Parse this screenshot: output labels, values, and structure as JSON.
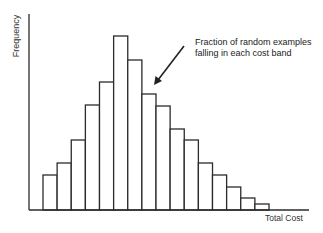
{
  "chart_data": {
    "type": "bar",
    "title": "",
    "xlabel": "Total Cost",
    "ylabel": "Frequency",
    "categories": [
      "1",
      "2",
      "3",
      "4",
      "5",
      "6",
      "7",
      "8",
      "9",
      "10",
      "11",
      "12",
      "13",
      "14",
      "15",
      "16"
    ],
    "values": [
      35,
      47,
      70,
      105,
      128,
      174,
      150,
      116,
      104,
      81,
      70,
      47,
      35,
      23,
      12,
      6
    ],
    "value_units": "relative frequency (unlabeled axis, estimated bar heights)",
    "ylim": [
      0,
      196
    ],
    "grid": false,
    "legend": null,
    "x_ticks": [],
    "y_ticks": [],
    "annotations": [
      {
        "text_lines": [
          "Fraction of random examples",
          "falling in each cost band"
        ],
        "arrow_points_to_bar": 8
      }
    ],
    "bar_style": {
      "fill": "#ffffff",
      "stroke": "#2b2b2b"
    }
  },
  "labels": {
    "ylabel": "Frequency",
    "xlabel": "Total Cost",
    "annotation_line1": "Fraction of random examples",
    "annotation_line2": "falling in each cost band"
  },
  "colors": {
    "axis": "#2b2b2b",
    "bar_stroke": "#2b2b2b",
    "bar_fill": "#ffffff",
    "text": "#2a2a2a"
  }
}
